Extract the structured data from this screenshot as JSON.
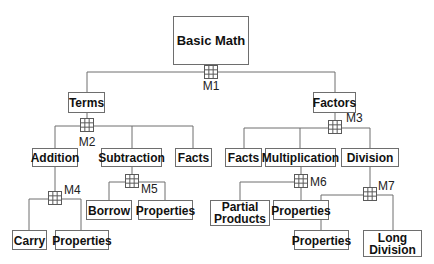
{
  "diagram": {
    "root": "Basic Math",
    "level1": {
      "terms": "Terms",
      "factors": "Factors"
    },
    "terms_children": {
      "addition": "Addition",
      "subtraction": "Subtraction",
      "facts": "Facts"
    },
    "factors_children": {
      "facts": "Facts",
      "multiplication": "Multiplication",
      "division": "Division"
    },
    "addition_children": {
      "carry": "Carry",
      "properties": "Properties"
    },
    "subtraction_children": {
      "borrow": "Borrow",
      "properties": "Properties"
    },
    "multiplication_children": {
      "partial_products_line1": "Partial",
      "partial_products_line2": "Products",
      "properties": "Properties"
    },
    "division_children": {
      "properties": "Properties",
      "long_division_line1": "Long",
      "long_division_line2": "Division"
    },
    "modules": {
      "m1": "M1",
      "m2": "M2",
      "m3": "M3",
      "m4": "M4",
      "m5": "M5",
      "m6": "M6",
      "m7": "M7"
    },
    "connector_icon": "grid-3x3-icon",
    "colors": {
      "line": "#6e6e6e",
      "text": "#111111",
      "background": "#ffffff"
    }
  }
}
